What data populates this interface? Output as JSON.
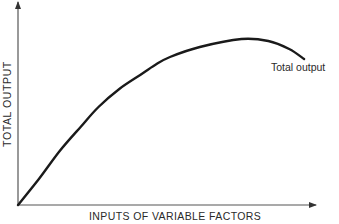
{
  "chart_data": {
    "type": "line",
    "title": "",
    "xlabel": "INPUTS OF VARIABLE FACTORS",
    "ylabel": "TOTAL OUTPUT",
    "x_ticks": [],
    "y_ticks": [],
    "grid": false,
    "axis_units": "relative (no numeric scale shown)",
    "xlim": [
      0,
      100
    ],
    "ylim": [
      0,
      100
    ],
    "series": [
      {
        "name": "Total output",
        "label_position": "end of curve, below-right",
        "color": "#1a1a1a",
        "x": [
          0,
          7,
          14,
          21,
          27,
          34,
          41,
          46,
          51,
          61,
          75,
          84,
          91,
          96
        ],
        "y": [
          0,
          13,
          27,
          39,
          49,
          58,
          65,
          70,
          74,
          79,
          83,
          82,
          78,
          73
        ]
      }
    ],
    "annotations": [
      {
        "text": "Total output",
        "attached_to": "series end"
      }
    ]
  },
  "axes": {
    "x_label": "INPUTS OF VARIABLE FACTORS",
    "y_label": "TOTAL OUTPUT"
  },
  "legend": {
    "series_label": "Total output"
  },
  "colors": {
    "line": "#1a1a1a",
    "axis": "#444444",
    "background": "#ffffff"
  }
}
